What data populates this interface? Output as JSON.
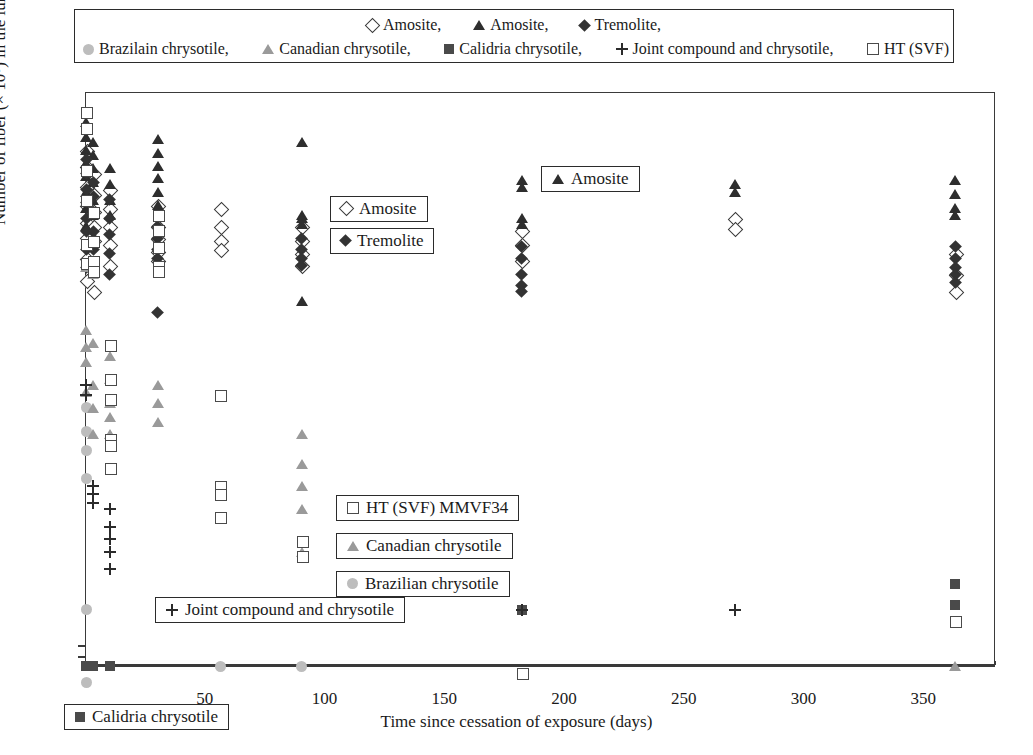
{
  "top_caption": "",
  "legend": {
    "rows": [
      [
        {
          "marker": "diamond-open",
          "label": "Amosite,"
        },
        {
          "marker": "triangle-dark",
          "label": "Amosite,"
        },
        {
          "marker": "diamond-fill",
          "label": "Tremolite,"
        }
      ],
      [
        {
          "marker": "circle-grey",
          "label": "Brazilain chrysotile,"
        },
        {
          "marker": "triangle-grey",
          "label": "Canadian chrysotile,"
        },
        {
          "marker": "square-fill",
          "label": "Calidria chrysotile,"
        },
        {
          "marker": "plus",
          "label": "Joint compound and chrysotile,"
        },
        {
          "marker": "square-open",
          "label": "HT (SVF)"
        }
      ]
    ]
  },
  "annotations": [
    {
      "id": "amosite-open",
      "marker": "diamond-open",
      "label": "Amosite"
    },
    {
      "id": "tremolite",
      "marker": "diamond-fill",
      "label": "Tremolite"
    },
    {
      "id": "amosite-filled",
      "marker": "triangle-dark",
      "label": "Amosite"
    },
    {
      "id": "ht-svf",
      "marker": "square-open",
      "label": "HT (SVF) MMVF34"
    },
    {
      "id": "canadian",
      "marker": "triangle-grey",
      "label": "Canadian chrysotile"
    },
    {
      "id": "brazilian",
      "marker": "circle-grey",
      "label": "Brazilian chrysotile"
    },
    {
      "id": "joint-compound",
      "marker": "plus",
      "label": "Joint compound and chrysotile"
    },
    {
      "id": "calidria",
      "marker": "square-fill",
      "label": "Calidria chrysotile"
    }
  ],
  "chart_data": {
    "type": "scatter",
    "title": "",
    "xlabel": "Time since cessation of exposure (days)",
    "ylabel": "Number of fiber (× 10⁶) in the lung with L > 20 μm",
    "yscale": "log-with-zero-break",
    "ylim": [
      0.005,
      5.0
    ],
    "yticks": [
      5.0,
      1.0,
      0.5,
      0.1,
      0.05,
      0.01,
      0.005,
      0
    ],
    "ytick_labels": [
      "5.0",
      "1.0",
      "0.5",
      "0.1",
      "0.05",
      "0.01",
      "0.005",
      "0"
    ],
    "xlim": [
      0,
      380
    ],
    "xticks": [
      50,
      100,
      150,
      200,
      250,
      300,
      350
    ],
    "xtick_labels": [
      "50",
      "100",
      "150",
      "200",
      "250",
      "300",
      "350"
    ],
    "xticks_minor_step": 10,
    "grid": false,
    "legend_position": "top-outside",
    "series": [
      {
        "name": "Amosite (open diamond)",
        "marker": "diamond-open",
        "points": [
          [
            0,
            2.6
          ],
          [
            0,
            2.1
          ],
          [
            0,
            1.6
          ],
          [
            0,
            1.25
          ],
          [
            0,
            1.0
          ],
          [
            0,
            0.82
          ],
          [
            0,
            0.62
          ],
          [
            0,
            0.46
          ],
          [
            3,
            1.9
          ],
          [
            3,
            1.45
          ],
          [
            3,
            1.15
          ],
          [
            3,
            0.95
          ],
          [
            3,
            0.78
          ],
          [
            3,
            0.4
          ],
          [
            10,
            1.55
          ],
          [
            10,
            1.2
          ],
          [
            10,
            0.95
          ],
          [
            10,
            0.74
          ],
          [
            10,
            0.56
          ],
          [
            30,
            1.25
          ],
          [
            30,
            0.95
          ],
          [
            30,
            0.8
          ],
          [
            30,
            0.68
          ],
          [
            30,
            0.6
          ],
          [
            56,
            1.2
          ],
          [
            56,
            0.95
          ],
          [
            56,
            0.78
          ],
          [
            56,
            0.7
          ],
          [
            90,
            0.95
          ],
          [
            90,
            0.78
          ],
          [
            90,
            0.66
          ],
          [
            90,
            0.56
          ],
          [
            182,
            0.9
          ],
          [
            182,
            0.74
          ],
          [
            182,
            0.6
          ],
          [
            271,
            1.05
          ],
          [
            271,
            0.92
          ],
          [
            363,
            0.66
          ],
          [
            363,
            0.5
          ],
          [
            363,
            0.4
          ]
        ]
      },
      {
        "name": "Amosite (filled triangle)",
        "marker": "triangle-dark",
        "points": [
          [
            0,
            3.8
          ],
          [
            0,
            3.1
          ],
          [
            0,
            2.6
          ],
          [
            0,
            2.2
          ],
          [
            0,
            1.85
          ],
          [
            0,
            1.5
          ],
          [
            0,
            1.2
          ],
          [
            0,
            0.95
          ],
          [
            3,
            2.9
          ],
          [
            3,
            2.45
          ],
          [
            3,
            2.05
          ],
          [
            3,
            1.7
          ],
          [
            3,
            1.35
          ],
          [
            3,
            1.1
          ],
          [
            10,
            2.05
          ],
          [
            10,
            1.65
          ],
          [
            10,
            1.35
          ],
          [
            10,
            1.1
          ],
          [
            30,
            3.0
          ],
          [
            30,
            2.5
          ],
          [
            30,
            2.1
          ],
          [
            30,
            1.8
          ],
          [
            30,
            1.5
          ],
          [
            30,
            1.25
          ],
          [
            90,
            2.9
          ],
          [
            90,
            1.1
          ],
          [
            90,
            1.05
          ],
          [
            90,
            0.98
          ],
          [
            90,
            0.35
          ],
          [
            182,
            1.75
          ],
          [
            182,
            1.6
          ],
          [
            182,
            1.05
          ],
          [
            182,
            0.98
          ],
          [
            271,
            1.65
          ],
          [
            271,
            1.5
          ],
          [
            363,
            1.75
          ],
          [
            363,
            1.45
          ],
          [
            363,
            1.2
          ],
          [
            363,
            1.1
          ]
        ]
      },
      {
        "name": "Tremolite",
        "marker": "diamond-fill",
        "points": [
          [
            0,
            2.3
          ],
          [
            0,
            1.9
          ],
          [
            0,
            1.55
          ],
          [
            0,
            1.3
          ],
          [
            0,
            1.05
          ],
          [
            0,
            0.88
          ],
          [
            0,
            0.7
          ],
          [
            0,
            0.55
          ],
          [
            3,
            1.7
          ],
          [
            3,
            1.4
          ],
          [
            3,
            1.1
          ],
          [
            3,
            0.88
          ],
          [
            3,
            0.7
          ],
          [
            3,
            0.55
          ],
          [
            10,
            1.35
          ],
          [
            10,
            1.05
          ],
          [
            10,
            0.85
          ],
          [
            10,
            0.66
          ],
          [
            10,
            0.5
          ],
          [
            30,
            0.95
          ],
          [
            30,
            0.8
          ],
          [
            30,
            0.7
          ],
          [
            30,
            0.62
          ],
          [
            30,
            0.3
          ],
          [
            90,
            0.8
          ],
          [
            90,
            0.7
          ],
          [
            90,
            0.62
          ],
          [
            90,
            0.56
          ],
          [
            182,
            0.72
          ],
          [
            182,
            0.62
          ],
          [
            182,
            0.5
          ],
          [
            182,
            0.43
          ],
          [
            182,
            0.4
          ],
          [
            363,
            0.72
          ],
          [
            363,
            0.62
          ],
          [
            363,
            0.55
          ],
          [
            363,
            0.5
          ],
          [
            363,
            0.45
          ]
        ]
      },
      {
        "name": "Brazilain chrysotile",
        "marker": "circle-grey",
        "points": [
          [
            0,
            0.085
          ],
          [
            0,
            0.062
          ],
          [
            0,
            0.048
          ],
          [
            0,
            0.033
          ],
          [
            0,
            0.0058
          ],
          [
            0,
            0.0022
          ],
          [
            56,
            0
          ],
          [
            90,
            0
          ]
        ]
      },
      {
        "name": "Canadian chrysotile",
        "marker": "triangle-grey",
        "points": [
          [
            0,
            0.55
          ],
          [
            0,
            0.24
          ],
          [
            0,
            0.19
          ],
          [
            0,
            0.155
          ],
          [
            0,
            0.105
          ],
          [
            3,
            0.5
          ],
          [
            3,
            0.2
          ],
          [
            3,
            0.115
          ],
          [
            3,
            0.085
          ],
          [
            3,
            0.06
          ],
          [
            10,
            0.17
          ],
          [
            10,
            0.125
          ],
          [
            10,
            0.09
          ],
          [
            10,
            0.075
          ],
          [
            10,
            0.06
          ],
          [
            30,
            0.115
          ],
          [
            30,
            0.09
          ],
          [
            30,
            0.07
          ],
          [
            90,
            0.06
          ],
          [
            90,
            0.04
          ],
          [
            90,
            0.03
          ],
          [
            90,
            0.022
          ],
          [
            90,
            0.0125
          ],
          [
            363,
            0
          ]
        ]
      },
      {
        "name": "Calidria chrysotile",
        "marker": "square-fill",
        "points": [
          [
            0,
            0
          ],
          [
            3,
            0
          ],
          [
            10,
            0
          ],
          [
            90,
            0.0115
          ],
          [
            182,
            0.0058
          ],
          [
            363,
            0.0082
          ],
          [
            363,
            0.0062
          ]
        ]
      },
      {
        "name": "Joint compound and chrysotile",
        "marker": "plus",
        "points": [
          [
            0,
            0.115
          ],
          [
            0,
            0.1
          ],
          [
            3,
            0.03
          ],
          [
            3,
            0.027
          ],
          [
            3,
            0.024
          ],
          [
            10,
            0.022
          ],
          [
            10,
            0.0175
          ],
          [
            10,
            0.0148
          ],
          [
            10,
            0.0125
          ],
          [
            10,
            0.01
          ],
          [
            182,
            0.0058
          ],
          [
            271,
            0.0058
          ]
        ]
      },
      {
        "name": "HT (SVF)",
        "marker": "square-open",
        "points": [
          [
            0,
            4.3
          ],
          [
            0,
            3.5
          ],
          [
            0,
            2.0
          ],
          [
            0,
            1.35
          ],
          [
            0,
            0.75
          ],
          [
            0,
            0.58
          ],
          [
            3,
            1.15
          ],
          [
            3,
            0.78
          ],
          [
            3,
            0.6
          ],
          [
            3,
            0.52
          ],
          [
            10,
            0.195
          ],
          [
            10,
            0.125
          ],
          [
            10,
            0.095
          ],
          [
            10,
            0.056
          ],
          [
            10,
            0.052
          ],
          [
            10,
            0.038
          ],
          [
            30,
            1.1
          ],
          [
            30,
            0.9
          ],
          [
            30,
            0.72
          ],
          [
            30,
            0.56
          ],
          [
            30,
            0.52
          ],
          [
            56,
            0.1
          ],
          [
            56,
            0.03
          ],
          [
            56,
            0.027
          ],
          [
            56,
            0.02
          ],
          [
            90,
            0.0145
          ],
          [
            90,
            0.0118
          ],
          [
            182,
            0.0025
          ],
          [
            363,
            0.005
          ]
        ]
      }
    ]
  }
}
